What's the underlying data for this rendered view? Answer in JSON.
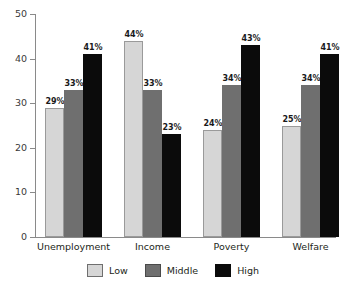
{
  "chart_data": {
    "type": "bar",
    "title": "",
    "subtitle": "",
    "xlabel": "",
    "ylabel": "",
    "ylim": [
      0,
      50
    ],
    "yticks": [
      0,
      10,
      20,
      30,
      40,
      50
    ],
    "ytick_labels": [
      "0",
      "10",
      "20",
      "30",
      "40",
      "50"
    ],
    "grid": false,
    "legend_position": "bottom",
    "value_suffix": "%",
    "categories": [
      "Unemployment",
      "Income",
      "Poverty",
      "Welfare"
    ],
    "series": [
      {
        "name": "Low",
        "color": "#d6d6d6",
        "values": [
          29,
          44,
          24,
          25
        ],
        "labels": [
          "29%",
          "44%",
          "24%",
          "25%"
        ]
      },
      {
        "name": "Middle",
        "color": "#6f6f6f",
        "values": [
          33,
          33,
          34,
          34
        ],
        "labels": [
          "33%",
          "33%",
          "34%",
          "34%"
        ]
      },
      {
        "name": "High",
        "color": "#0b0b0b",
        "values": [
          41,
          23,
          43,
          41
        ],
        "labels": [
          "41%",
          "23%",
          "43%",
          "41%"
        ]
      }
    ]
  },
  "legend": {
    "items": [
      {
        "label": "Low",
        "swatch": "swatch-low-icon"
      },
      {
        "label": "Middle",
        "swatch": "swatch-middle-icon"
      },
      {
        "label": "High",
        "swatch": "swatch-high-icon"
      }
    ]
  },
  "axis": {
    "y_tick_labels": [
      "50",
      "40",
      "30",
      "20",
      "10",
      "0"
    ],
    "x_tick_labels": [
      "Unemployment",
      "Income",
      "Poverty",
      "Welfare"
    ]
  }
}
